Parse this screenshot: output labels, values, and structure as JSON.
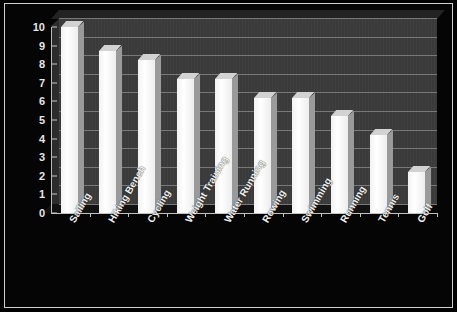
{
  "chart_data": {
    "type": "bar",
    "title": "",
    "xlabel": "",
    "ylabel": "",
    "categories": [
      "Sailing",
      "Hiking Bench",
      "Cycling",
      "Weight Training",
      "Water Running",
      "Rowing",
      "Swimming",
      "Running",
      "Tennis",
      "Golf"
    ],
    "values": [
      10,
      8.7,
      8.2,
      7.2,
      7.2,
      6.2,
      6.2,
      5.2,
      4.2,
      2.2
    ],
    "ylim": [
      0,
      10
    ],
    "ytick_labels": [
      "10",
      "9",
      "8",
      "7",
      "6",
      "5",
      "4",
      "3",
      "2",
      "1",
      "0"
    ],
    "ytick_values": [
      10,
      9,
      8,
      7,
      6,
      5,
      4,
      3,
      2,
      1,
      0
    ],
    "grid": true,
    "legend": false,
    "style": "3d-column",
    "colors": {
      "background": "#000000",
      "plot_wall": "#3b3b3b",
      "gridline": "#787878",
      "bar_face": "#ffffff",
      "bar_side": "#9a9a9a",
      "bar_top": "#d2d2d2",
      "axis": "#c2c2c2",
      "tick_text": "#e6e6e6",
      "frame_border": "#cfcfcf"
    }
  }
}
